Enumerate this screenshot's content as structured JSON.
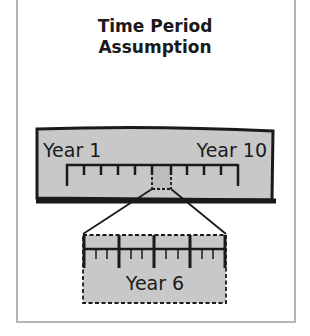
{
  "title": {
    "line1": "Time Period",
    "line2": "Assumption"
  },
  "timeline": {
    "start_label": "Year 1",
    "end_label": "Year 10",
    "intervals": 10,
    "highlighted_interval": 6
  },
  "zoom_box": {
    "label": "Year 6",
    "major_divisions": 4,
    "minor_per_division": 3
  },
  "colors": {
    "box_fill": "#c8c8c8",
    "ink": "#1a1a1a",
    "frame": "#b4b4b4",
    "highlight_fill": "#bdbdbd"
  }
}
